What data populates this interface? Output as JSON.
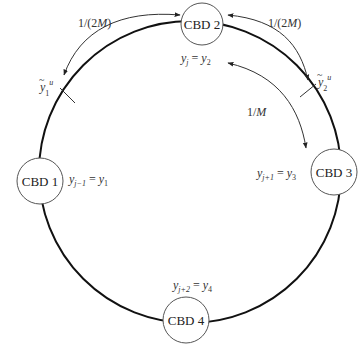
{
  "diagram": {
    "nodes": [
      {
        "id": "cbd1",
        "label": "CBD 1",
        "annotation": {
          "lhs_sub": "j−1",
          "rhs_sub": "1"
        }
      },
      {
        "id": "cbd2",
        "label": "CBD 2",
        "annotation": {
          "lhs_sub": "j",
          "rhs_sub": "2"
        }
      },
      {
        "id": "cbd3",
        "label": "CBD 3",
        "annotation": {
          "lhs_sub": "j+1",
          "rhs_sub": "3"
        }
      },
      {
        "id": "cbd4",
        "label": "CBD 4",
        "annotation": {
          "lhs_sub": "j+2",
          "rhs_sub": "4"
        }
      }
    ],
    "var": "y",
    "eq": " = ",
    "arcs": [
      {
        "id": "arc-left-half",
        "label_main": "1/(2",
        "label_var": "M",
        "label_close": ")"
      },
      {
        "id": "arc-right-half",
        "label_main": "1/(2",
        "label_var": "M",
        "label_close": ")"
      },
      {
        "id": "arc-right-full",
        "label_main": "1/",
        "label_var": "M",
        "label_close": ""
      }
    ],
    "markers": [
      {
        "id": "y1-tilde",
        "var": "y",
        "tilde": "~",
        "sub": "1",
        "sup": "u"
      },
      {
        "id": "y2-tilde",
        "var": "y",
        "tilde": "~",
        "sub": "2",
        "sup": "u"
      }
    ],
    "colors": {
      "ring": "#111111",
      "node_stroke": "#555555",
      "arrow": "#333333",
      "text": "#222222"
    }
  }
}
